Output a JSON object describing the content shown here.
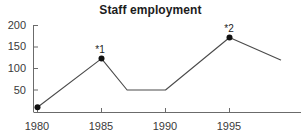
{
  "chart_data": {
    "type": "line",
    "title": "Staff employment",
    "xlabel": "",
    "ylabel": "",
    "grid": false,
    "legend": false,
    "xlim": [
      1980,
      1999
    ],
    "ylim": [
      0,
      200
    ],
    "x_ticks": [
      "1980",
      "1985",
      "1990",
      "1995"
    ],
    "x_tick_values": [
      1980,
      1985,
      1990,
      1995
    ],
    "y_ticks": [
      "50",
      "100",
      "150",
      "200"
    ],
    "y_tick_values": [
      50,
      100,
      150,
      200
    ],
    "series": [
      {
        "name": "Staff employment",
        "color": "#4a4a4a",
        "x": [
          1980,
          1985,
          1987,
          1990,
          1995,
          1999
        ],
        "values": [
          10,
          123,
          50,
          50,
          172,
          120
        ]
      }
    ],
    "markers": [
      {
        "x": 1980,
        "y": 10,
        "label": ""
      },
      {
        "x": 1985,
        "y": 123,
        "label": "*1"
      },
      {
        "x": 1995,
        "y": 172,
        "label": "*2"
      }
    ],
    "annotations": [
      {
        "text": "*1",
        "x": 1985,
        "y": 123
      },
      {
        "text": "*2",
        "x": 1995,
        "y": 172
      }
    ]
  },
  "axis": {
    "line_color": "#6b6b6b",
    "tick_color": "#6b6b6b"
  }
}
